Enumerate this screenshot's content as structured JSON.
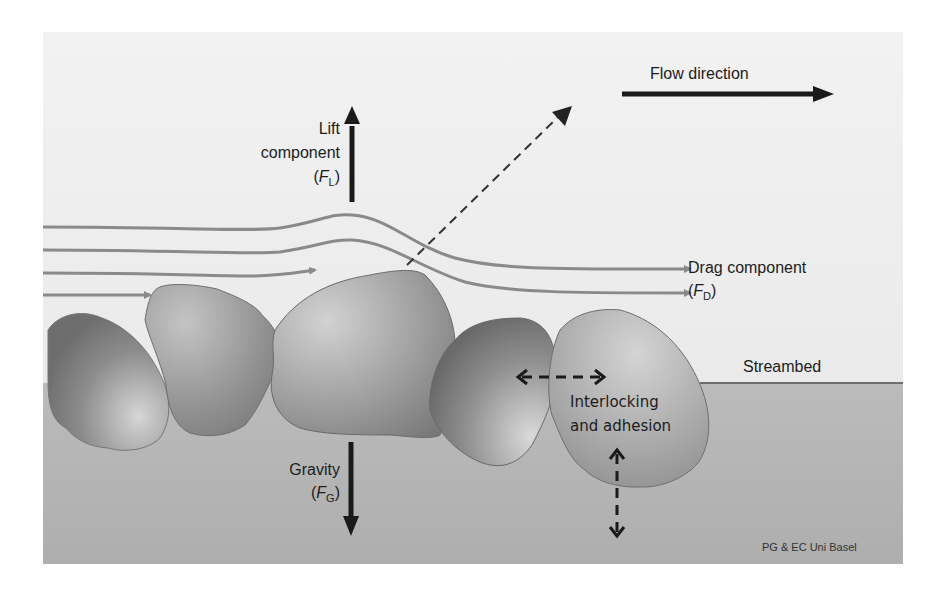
{
  "diagram": {
    "colors": {
      "page_background": "#ffffff",
      "water": "#ebebeb",
      "bed": "#b4b4b4",
      "streamline": "#8a8a8a",
      "arrow": "#1a1a1a"
    },
    "labels": {
      "flow_direction": "Flow direction",
      "lift_line1": "Lift",
      "lift_line2": "component",
      "lift_symbol": "F",
      "lift_subscript": "L",
      "drag_line1": "Drag component",
      "drag_symbol": "F",
      "drag_subscript": "D",
      "gravity_line1": "Gravity",
      "gravity_symbol": "F",
      "gravity_subscript": "G",
      "streambed": "Streambed",
      "interlocking_line1": "Interlocking",
      "interlocking_line2": "and adhesion",
      "credit": "PG & EC Uni Basel"
    },
    "arrows": [
      {
        "name": "flow-direction",
        "style": "solid",
        "direction": "right"
      },
      {
        "name": "lift-force",
        "style": "solid",
        "direction": "up"
      },
      {
        "name": "gravity-force",
        "style": "solid",
        "direction": "down"
      },
      {
        "name": "resultant-force",
        "style": "dashed",
        "direction": "up-right"
      },
      {
        "name": "interlocking-horizontal",
        "style": "dashed",
        "direction": "both-horizontal"
      },
      {
        "name": "adhesion-vertical",
        "style": "dashed",
        "direction": "both-vertical"
      }
    ],
    "streamlines": 5,
    "stones": 5
  }
}
